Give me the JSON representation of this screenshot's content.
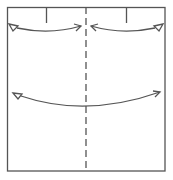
{
  "diagram": {
    "type": "fold-instruction",
    "stroke_color": "#555555",
    "background": "#ffffff",
    "square": {
      "x": 7,
      "y": 7,
      "w": 158,
      "h": 164
    },
    "center_fold_line": {
      "style": "dashed",
      "x": 86
    },
    "tick_marks": [
      {
        "x": 46,
        "y1": 7,
        "y2": 23
      },
      {
        "x": 126,
        "y1": 7,
        "y2": 23
      }
    ],
    "arrows": [
      {
        "name": "upper-left-arrow",
        "from": "left edge",
        "to": "center",
        "tail": "hollow-triangle",
        "head": "open"
      },
      {
        "name": "upper-right-arrow",
        "from": "right edge",
        "to": "center",
        "tail": "hollow-triangle",
        "head": "open"
      },
      {
        "name": "lower-arrow",
        "from": "left edge",
        "to": "right edge",
        "tail": "hollow-triangle",
        "head": "open"
      }
    ]
  }
}
